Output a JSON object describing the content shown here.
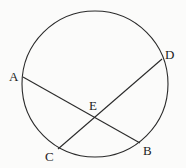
{
  "diagram": {
    "circle": {
      "cx": 95,
      "cy": 84,
      "r": 73
    },
    "points": {
      "A": {
        "label": "A",
        "x": 23,
        "y": 77,
        "lx": 9,
        "ly": 81
      },
      "B": {
        "label": "B",
        "x": 140,
        "y": 143,
        "lx": 143,
        "ly": 155
      },
      "C": {
        "label": "C",
        "x": 58,
        "y": 149,
        "lx": 45,
        "ly": 161
      },
      "D": {
        "label": "D",
        "x": 162,
        "y": 59,
        "lx": 165,
        "ly": 59
      },
      "E": {
        "label": "E",
        "x": 95,
        "y": 116,
        "lx": 89,
        "ly": 110
      }
    },
    "chords": [
      {
        "from": "A",
        "to": "B"
      },
      {
        "from": "C",
        "to": "D"
      }
    ]
  }
}
